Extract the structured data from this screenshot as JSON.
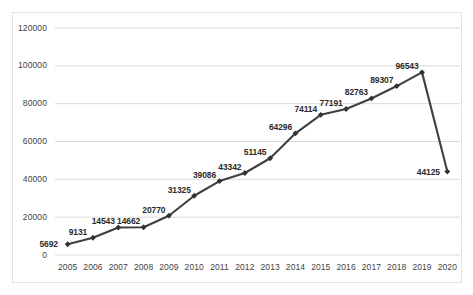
{
  "chart_data": {
    "type": "line",
    "title": "",
    "subtitle": "",
    "xlabel": "",
    "ylabel": "",
    "categories": [
      "2005",
      "2006",
      "2007",
      "2008",
      "2009",
      "2010",
      "2011",
      "2012",
      "2013",
      "2014",
      "2015",
      "2016",
      "2017",
      "2018",
      "2019",
      "2020"
    ],
    "values": [
      5692,
      9131,
      14543,
      14662,
      20770,
      31325,
      39086,
      43342,
      51145,
      64296,
      74114,
      77191,
      82763,
      89307,
      96543,
      44125
    ],
    "series": [
      {
        "name": "",
        "values": [
          5692,
          9131,
          14543,
          14662,
          20770,
          31325,
          39086,
          43342,
          51145,
          64296,
          74114,
          77191,
          82763,
          89307,
          96543,
          44125
        ]
      }
    ],
    "data_labels": [
      "5692",
      "9131",
      "14543",
      "14662",
      "20770",
      "31325",
      "39086",
      "43342",
      "51145",
      "64296",
      "74114",
      "77191",
      "82763",
      "89307",
      "96543",
      "44125"
    ],
    "ylim": [
      0,
      120000
    ],
    "ytick_labels": [
      "120000",
      "100000",
      "80000",
      "60000",
      "40000",
      "20000",
      "0"
    ],
    "ytick_values": [
      120000,
      100000,
      80000,
      60000,
      40000,
      20000,
      0
    ],
    "xtick_labels": [
      "2005",
      "2006",
      "2007",
      "2008",
      "2009",
      "2010",
      "2011",
      "2012",
      "2013",
      "2014",
      "2015",
      "2016",
      "2017",
      "2018",
      "2019",
      "2020"
    ],
    "grid": true,
    "grid_axis": "y",
    "legend": false,
    "legend_position": "none",
    "marker": "diamond",
    "line_color": "#404040",
    "marker_color": "#333333",
    "gridline_color": "#d9d9d9",
    "border_color": "#e3e3e3",
    "background_color": "#ffffff",
    "axis_text_color": "#3f3f3f",
    "label_text_color": "#2b2b2b"
  }
}
